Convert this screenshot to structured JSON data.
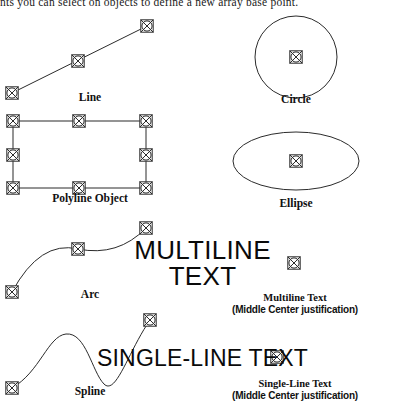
{
  "document": {
    "intro_text": "nts you can select on objects to define a new array base point."
  },
  "figure": {
    "marker_icon": "snap-point-marker-icon",
    "stroke_color": "#2b2b2b",
    "text_color": "#0a0a0a",
    "objects": [
      {
        "id": "line",
        "label": "Line",
        "shape": "line",
        "snap_points": [
          {
            "x": 12,
            "y": 93,
            "name": "start-point"
          },
          {
            "x": 78,
            "y": 61,
            "name": "midpoint"
          },
          {
            "x": 147,
            "y": 26,
            "name": "end-point"
          }
        ]
      },
      {
        "id": "polyline",
        "label": "Polyline Object",
        "shape": "rectangle",
        "snap_points": [
          {
            "x": 13,
            "y": 121,
            "name": "corner-top-left"
          },
          {
            "x": 79,
            "y": 121,
            "name": "midpoint-top"
          },
          {
            "x": 146,
            "y": 121,
            "name": "corner-top-right"
          },
          {
            "x": 13,
            "y": 155,
            "name": "midpoint-left"
          },
          {
            "x": 146,
            "y": 155,
            "name": "midpoint-right"
          },
          {
            "x": 13,
            "y": 188,
            "name": "corner-bottom-left"
          },
          {
            "x": 79,
            "y": 188,
            "name": "midpoint-bottom"
          },
          {
            "x": 146,
            "y": 188,
            "name": "corner-bottom-right"
          }
        ]
      },
      {
        "id": "arc",
        "label": "Arc",
        "shape": "arc",
        "snap_points": [
          {
            "x": 12,
            "y": 292,
            "name": "start-point"
          },
          {
            "x": 78,
            "y": 249,
            "name": "midpoint"
          },
          {
            "x": 146,
            "y": 228,
            "name": "end-point"
          }
        ]
      },
      {
        "id": "spline",
        "label": "Spline",
        "shape": "spline",
        "snap_points": [
          {
            "x": 12,
            "y": 388,
            "name": "start-point"
          },
          {
            "x": 150,
            "y": 320,
            "name": "end-point"
          }
        ]
      },
      {
        "id": "circle",
        "label": "Circle",
        "shape": "circle",
        "snap_points": [
          {
            "x": 296,
            "y": 57,
            "name": "center-point"
          }
        ]
      },
      {
        "id": "ellipse",
        "label": "Ellipse",
        "shape": "ellipse",
        "snap_points": [
          {
            "x": 296,
            "y": 161,
            "name": "center-point"
          }
        ]
      },
      {
        "id": "multiline-text",
        "label": "Multiline Text",
        "sublabel": "(Middle Center justification)",
        "shape": "text",
        "sample_line_1": "MULTILINE",
        "sample_line_2": "TEXT",
        "snap_points": [
          {
            "x": 294,
            "y": 263,
            "name": "insertion-point"
          }
        ]
      },
      {
        "id": "single-line-text",
        "label": "Single-Line Text",
        "sublabel": "(Middle Center justification)",
        "shape": "text",
        "sample_line_1": "SINGLE-LINE TEXT",
        "snap_points": [
          {
            "x": 277,
            "y": 357,
            "name": "insertion-point"
          }
        ]
      }
    ]
  },
  "captions": {
    "line": "Line",
    "polyline": "Polyline Object",
    "arc": "Arc",
    "spline": "Spline",
    "circle": "Circle",
    "ellipse": "Ellipse",
    "multiline_text": "Multiline Text",
    "multiline_text_just": "(Middle Center justification)",
    "single_line_text": "Single-Line Text",
    "single_line_text_just": "(Middle Center justification)"
  },
  "sample_text": {
    "multiline_line1": "MULTILINE",
    "multiline_line2": "TEXT",
    "single_line": "SINGLE-LINE TEXT"
  }
}
